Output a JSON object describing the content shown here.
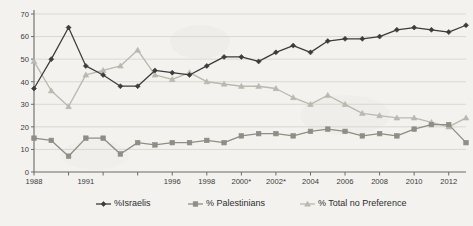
{
  "chart_data": {
    "type": "line",
    "title": "",
    "xlabel": "",
    "ylabel": "",
    "ylim": [
      0,
      70
    ],
    "ytick_step": 10,
    "yticks": [
      0,
      10,
      20,
      30,
      40,
      50,
      60,
      70
    ],
    "grid": true,
    "legend_position": "bottom",
    "x": [
      "1988",
      "1989",
      "1990",
      "1991",
      "1992",
      "1993",
      "1994",
      "1995",
      "1996",
      "1997",
      "1998",
      "1999",
      "2000*",
      "2001",
      "2002*",
      "2003",
      "2004",
      "2005",
      "2006",
      "2007",
      "2008",
      "2009",
      "2010",
      "2011",
      "2012",
      "2013"
    ],
    "xtick_labels": [
      "1988",
      "",
      "",
      "1991",
      "",
      "",
      "",
      "",
      "1996",
      "",
      "1998",
      "",
      "2000*",
      "",
      "2002*",
      "",
      "2004",
      "",
      "2006",
      "",
      "2008",
      "",
      "2010",
      "",
      "2012",
      ""
    ],
    "series": [
      {
        "name": "%Israelis",
        "color": "#3c3c3c",
        "marker": "diamond",
        "values": [
          37,
          50,
          64,
          47,
          43,
          38,
          38,
          45,
          44,
          43,
          47,
          51,
          51,
          49,
          53,
          56,
          53,
          58,
          59,
          59,
          60,
          63,
          64,
          63,
          62,
          65
        ]
      },
      {
        "name": "% Palestinians",
        "color": "#8e8e84",
        "marker": "square",
        "values": [
          15,
          14,
          7,
          15,
          15,
          8,
          13,
          12,
          13,
          13,
          14,
          13,
          16,
          17,
          17,
          16,
          18,
          19,
          18,
          16,
          17,
          16,
          19,
          21,
          21,
          13
        ]
      },
      {
        "name": "% Total no Preference",
        "color": "#b9b9ae",
        "marker": "triangle",
        "values": [
          49,
          36,
          29,
          43,
          45,
          47,
          54,
          43,
          41,
          44,
          40,
          39,
          38,
          38,
          37,
          33,
          30,
          34,
          30,
          26,
          25,
          24,
          24,
          22,
          20,
          24
        ]
      }
    ]
  },
  "legend": {
    "items": [
      {
        "label": "%Israelis"
      },
      {
        "label": "% Palestinians"
      },
      {
        "label": "% Total no Preference"
      }
    ]
  }
}
